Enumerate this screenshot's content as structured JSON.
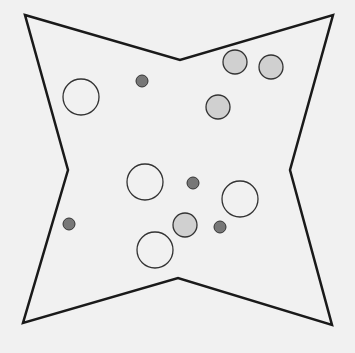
{
  "diagram": {
    "background": "#f1f1f1",
    "shape": {
      "type": "four-pointed-star",
      "stroke": "#1a1a1a",
      "points": [
        [
          25,
          15
        ],
        [
          180,
          60
        ],
        [
          333,
          15
        ],
        [
          290,
          170
        ],
        [
          332,
          325
        ],
        [
          178,
          278
        ],
        [
          23,
          323
        ],
        [
          68,
          170
        ]
      ]
    },
    "circles": {
      "large_empty": [
        {
          "cx": 81,
          "cy": 97,
          "r": 18
        },
        {
          "cx": 145,
          "cy": 182,
          "r": 18
        },
        {
          "cx": 240,
          "cy": 199,
          "r": 18
        },
        {
          "cx": 155,
          "cy": 250,
          "r": 18
        }
      ],
      "medium_light_gray": [
        {
          "cx": 235,
          "cy": 62,
          "r": 12
        },
        {
          "cx": 271,
          "cy": 67,
          "r": 12
        },
        {
          "cx": 218,
          "cy": 107,
          "r": 12
        },
        {
          "cx": 185,
          "cy": 225,
          "r": 12
        }
      ],
      "small_dark_gray": [
        {
          "cx": 142,
          "cy": 81,
          "r": 6
        },
        {
          "cx": 193,
          "cy": 183,
          "r": 6
        },
        {
          "cx": 69,
          "cy": 224,
          "r": 6
        },
        {
          "cx": 220,
          "cy": 227,
          "r": 6
        }
      ]
    },
    "colors": {
      "empty_fill": "none",
      "light_fill": "#d0d0d0",
      "dark_fill": "#777777",
      "circle_stroke": "#333333"
    }
  }
}
